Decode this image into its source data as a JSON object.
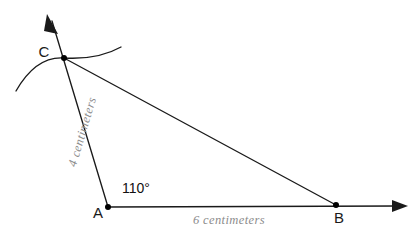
{
  "diagram": {
    "background_color": "#ffffff",
    "line_color": "#1a1a1a",
    "measure_label_color": "#8c8c8c",
    "vertices": {
      "A": {
        "label": "A",
        "x": 108,
        "y": 207
      },
      "B": {
        "label": "B",
        "x": 336,
        "y": 205
      },
      "C": {
        "label": "C",
        "x": 64,
        "y": 58
      }
    },
    "angle": {
      "at_vertex": "A",
      "label": "110°",
      "value": 110,
      "unit": "degrees"
    },
    "sides": [
      {
        "name": "side-AC",
        "from": "A",
        "to": "C",
        "label": "4 centimeters",
        "length": 4,
        "unit": "centimeters"
      },
      {
        "name": "side-AB",
        "from": "A",
        "to": "B",
        "label": "6 centimeters",
        "length": 6,
        "unit": "centimeters"
      },
      {
        "name": "side-CB",
        "from": "C",
        "to": "B",
        "label": "",
        "length": null,
        "unit": ""
      }
    ],
    "rays": [
      {
        "name": "ray-AC-extended",
        "from": "A",
        "through": "C",
        "arrow_tip_x": 47,
        "arrow_tip_y": 14
      },
      {
        "name": "ray-AB-extended",
        "from": "A",
        "through": "B",
        "arrow_tip_x": 408,
        "arrow_tip_y": 206
      }
    ],
    "arc": {
      "name": "construction-arc-through-C",
      "start_x": 16,
      "start_y": 91,
      "end_x": 121,
      "end_y": 47,
      "passes_through": "C"
    }
  }
}
